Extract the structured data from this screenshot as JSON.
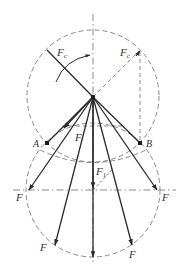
{
  "diagram": {
    "type": "force-vector-diagram",
    "colors": {
      "solid": "#2a2a2a",
      "dashed": "#8a8a8a",
      "label": "#333333",
      "background": "#ffffff"
    },
    "labels": {
      "fc_left": {
        "main": "F",
        "sub": "c"
      },
      "fc_right": {
        "main": "F",
        "sub": "c"
      },
      "f_inner": "F",
      "f1": {
        "main": "F",
        "sub": "1"
      },
      "point_a": "A",
      "point_b": "B",
      "f_left": "F",
      "f_right": "F",
      "f_lower_left": "F",
      "f_lower_right": "F"
    }
  }
}
